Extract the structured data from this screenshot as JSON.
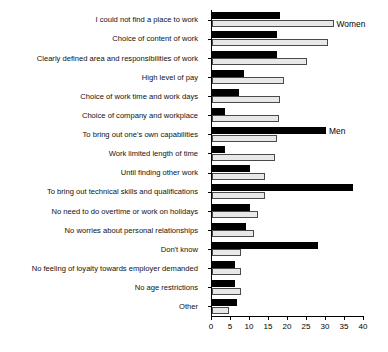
{
  "chart_data": {
    "type": "bar",
    "title": "",
    "subtitle": "",
    "xlabel": "",
    "ylabel": "",
    "orientation": "horizontal",
    "xlim": [
      0,
      40
    ],
    "xticks": [
      0,
      5,
      10,
      15,
      20,
      25,
      30,
      35,
      40
    ],
    "grid": false,
    "legend_position": "inline-annotation",
    "categories": [
      "I could not find a place to work",
      "Choice of content of work",
      "Clearly defined area and responsibilities of work",
      "High level of pay",
      "Choice of work time and work days",
      "Choice of company and workplace",
      "To bring out one's own capabilities",
      "Work limited length of time",
      "Until finding other work",
      "To bring out technical skills and qualifications",
      "No need to do overtime or work on holidays",
      "No worries about personal relationships",
      "Don't know",
      "No feeling of loyalty towards employer demanded",
      "No age restrictions",
      "Other"
    ],
    "series": [
      {
        "name": "Men",
        "color": "#000000",
        "values": [
          18,
          17,
          17,
          8.5,
          7,
          3.5,
          30,
          3.5,
          10,
          37,
          10,
          9,
          28,
          6,
          6,
          6.5
        ]
      },
      {
        "name": "Women",
        "color": "#e8e8e8",
        "values": [
          32,
          30.5,
          25,
          19,
          18,
          17.5,
          17,
          16.5,
          14,
          14,
          12,
          11,
          7.5,
          7.5,
          7.5,
          4.5
        ]
      }
    ],
    "annotations": [
      {
        "text": "Women",
        "series": "Women",
        "category_index": 0
      },
      {
        "text": "Men",
        "series": "Men",
        "category_index": 6
      }
    ]
  }
}
